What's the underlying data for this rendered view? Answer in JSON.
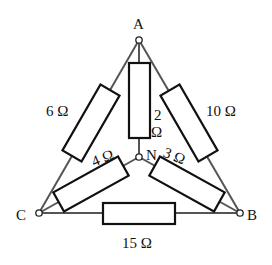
{
  "diagram": {
    "type": "resistor network (delta with star)",
    "nodes": {
      "A": {
        "label": "A"
      },
      "B": {
        "label": "B"
      },
      "C": {
        "label": "C"
      },
      "N": {
        "label": "N"
      }
    },
    "resistors": [
      {
        "id": "R_AC",
        "between": [
          "A",
          "C"
        ],
        "label": "6 Ω"
      },
      {
        "id": "R_AB",
        "between": [
          "A",
          "B"
        ],
        "label": "10 Ω"
      },
      {
        "id": "R_AN",
        "between": [
          "A",
          "N"
        ],
        "label_line1": "2",
        "label_line2": "Ω"
      },
      {
        "id": "R_CN",
        "between": [
          "C",
          "N"
        ],
        "label": "4 Ω"
      },
      {
        "id": "R_BN",
        "between": [
          "B",
          "N"
        ],
        "label": "3 Ω"
      },
      {
        "id": "R_CB",
        "between": [
          "C",
          "B"
        ],
        "label": "15 Ω"
      }
    ]
  }
}
